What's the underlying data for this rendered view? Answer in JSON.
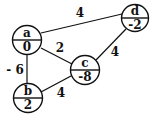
{
  "graph": {
    "nodes": [
      {
        "id": "a",
        "name": "a",
        "value": "0",
        "cx": 27,
        "cy": 40,
        "r": 14.5
      },
      {
        "id": "b",
        "name": "b",
        "value": "2",
        "cx": 28,
        "cy": 98,
        "r": 14.5
      },
      {
        "id": "c",
        "name": "c",
        "value": "-8",
        "cx": 85,
        "cy": 70,
        "r": 14.5
      },
      {
        "id": "d",
        "name": "d",
        "value": "-2",
        "cx": 135,
        "cy": 18,
        "r": 13.5
      }
    ],
    "edges": [
      {
        "from": "a",
        "to": "d",
        "weight": "4",
        "lx": 80,
        "ly": 17
      },
      {
        "from": "a",
        "to": "c",
        "weight": "2",
        "lx": 60,
        "ly": 52
      },
      {
        "from": "a",
        "to": "b",
        "weight": "- 6",
        "lx": 17,
        "ly": 74
      },
      {
        "from": "b",
        "to": "c",
        "weight": "4",
        "lx": 61,
        "ly": 97
      },
      {
        "from": "c",
        "to": "d",
        "weight": "4",
        "lx": 115,
        "ly": 56
      }
    ]
  }
}
